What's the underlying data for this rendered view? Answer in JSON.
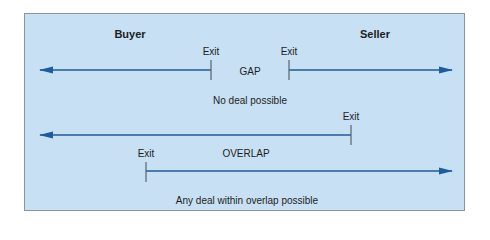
{
  "diagram": {
    "colors": {
      "panel_fill": "#c7e0f3",
      "panel_border": "#8d9399",
      "arrow": "#1f5c9c",
      "tick": "#556270",
      "text": "#1d1d1d"
    },
    "parties": {
      "buyer": "Buyer",
      "seller": "Seller"
    },
    "scenario_gap": {
      "buyer_exit_label": "Exit",
      "seller_exit_label": "Exit",
      "zone_label": "GAP",
      "caption": "No deal possible"
    },
    "scenario_overlap": {
      "buyer_exit_label": "Exit",
      "seller_exit_label": "Exit",
      "zone_label": "OVERLAP",
      "caption": "Any deal within overlap possible"
    }
  }
}
